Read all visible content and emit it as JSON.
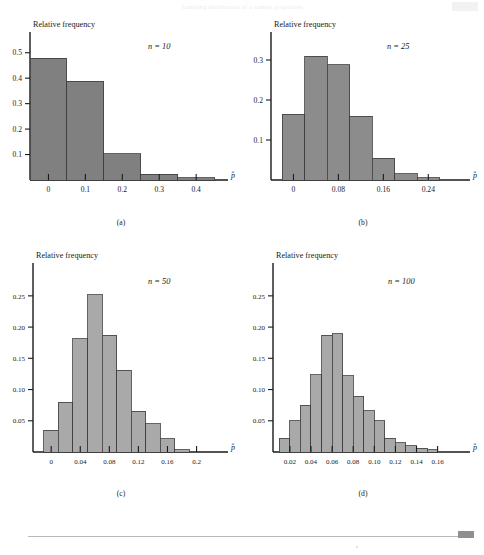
{
  "page": {
    "running_head": "Sampling distribution of a sample proportion",
    "footer_marker": "▬"
  },
  "figure": {
    "y_axis_title": "Relative frequency",
    "x_axis_symbol": "p̂",
    "panels": [
      {
        "id": "a",
        "caption": "(a)",
        "n_label": "n = 10",
        "n_value": 10,
        "bar_color": "#808080",
        "chart_data": {
          "type": "bar",
          "title": "Relative frequency",
          "xlabel": "p̂",
          "ylabel": "Relative frequency",
          "ylim": [
            0,
            0.55
          ],
          "xlim": [
            -0.05,
            0.47
          ],
          "grid": false,
          "legend": "none",
          "y_ticks": [
            0.1,
            0.2,
            0.3,
            0.4,
            0.5
          ],
          "y_tick_labels": [
            "0.1",
            "0.2",
            "0.3",
            "0.4",
            "0.5"
          ],
          "x_ticks": [
            0,
            0.1,
            0.2,
            0.3,
            0.4
          ],
          "x_tick_labels": [
            "0",
            "0.1",
            "0.2",
            "0.3",
            "0.4"
          ],
          "bin_width": 0.1,
          "bin_starts": [
            -0.05,
            0.05,
            0.15,
            0.25,
            0.35
          ],
          "categories": [
            "0.00",
            "0.10",
            "0.20",
            "0.30",
            "0.40"
          ],
          "values": [
            0.478,
            0.388,
            0.104,
            0.022,
            0.008
          ]
        }
      },
      {
        "id": "b",
        "caption": "(b)",
        "n_label": "n = 25",
        "n_value": 25,
        "bar_color": "#8c8c8c",
        "chart_data": {
          "type": "bar",
          "title": "Relative frequency",
          "xlabel": "p̂",
          "ylabel": "Relative frequency",
          "ylim": [
            0,
            0.345
          ],
          "xlim": [
            -0.04,
            0.3
          ],
          "grid": false,
          "legend": "none",
          "y_ticks": [
            0.1,
            0.2,
            0.3
          ],
          "y_tick_labels": [
            "0.1",
            "0.2",
            "0.3"
          ],
          "x_ticks": [
            0,
            0.08,
            0.16,
            0.24
          ],
          "x_tick_labels": [
            "0",
            "0.08",
            "0.16",
            "0.24"
          ],
          "bin_width": 0.04,
          "bin_starts": [
            -0.02,
            0.02,
            0.06,
            0.1,
            0.14,
            0.18,
            0.22
          ],
          "categories": [
            "0.00",
            "0.04",
            "0.08",
            "0.12",
            "0.16",
            "0.20",
            "0.24"
          ],
          "values": [
            0.165,
            0.31,
            0.288,
            0.16,
            0.055,
            0.016,
            0.006
          ]
        }
      },
      {
        "id": "c",
        "caption": "(c)",
        "n_label": "n = 50",
        "n_value": 50,
        "bar_color": "#a9a9a9",
        "chart_data": {
          "type": "bar",
          "title": "Relative frequency",
          "xlabel": "p̂",
          "ylabel": "Relative frequency",
          "ylim": [
            0,
            0.285
          ],
          "xlim": [
            -0.025,
            0.235
          ],
          "grid": false,
          "legend": "none",
          "y_ticks": [
            0.05,
            0.1,
            0.15,
            0.2,
            0.25
          ],
          "y_tick_labels": [
            "0.05",
            "0.10",
            "0.15",
            "0.20",
            "0.25"
          ],
          "x_ticks": [
            0,
            0.04,
            0.08,
            0.12,
            0.16,
            0.2
          ],
          "x_tick_labels": [
            "0",
            "0.04",
            "0.08",
            "0.12",
            "0.16",
            "0.2"
          ],
          "bin_width": 0.02,
          "bin_starts": [
            -0.01,
            0.01,
            0.03,
            0.05,
            0.07,
            0.09,
            0.11,
            0.13,
            0.15,
            0.17
          ],
          "categories": [
            "0.00",
            "0.02",
            "0.04",
            "0.06",
            "0.08",
            "0.10",
            "0.12",
            "0.14",
            "0.16",
            "0.18"
          ],
          "values": [
            0.035,
            0.08,
            0.181,
            0.252,
            0.187,
            0.131,
            0.065,
            0.045,
            0.021,
            0.004
          ]
        }
      },
      {
        "id": "d",
        "caption": "(d)",
        "n_label": "n = 100",
        "n_value": 100,
        "bar_color": "#a9a9a9",
        "chart_data": {
          "type": "bar",
          "title": "Relative frequency",
          "xlabel": "p̂",
          "ylabel": "Relative frequency",
          "ylim": [
            0,
            0.285
          ],
          "xlim": [
            0.004,
            0.185
          ],
          "grid": false,
          "legend": "none",
          "y_ticks": [
            0.05,
            0.1,
            0.15,
            0.2,
            0.25
          ],
          "y_tick_labels": [
            "0.05",
            "0.10",
            "0.15",
            "0.20",
            "0.25"
          ],
          "x_ticks": [
            0.02,
            0.04,
            0.06,
            0.08,
            0.1,
            0.12,
            0.14,
            0.16
          ],
          "x_tick_labels": [
            "0.02",
            "0.04",
            "0.06",
            "0.08",
            "0.10",
            "0.12",
            "0.14",
            "0.16"
          ],
          "bin_width": 0.01,
          "bin_starts": [
            0.01,
            0.02,
            0.03,
            0.04,
            0.05,
            0.06,
            0.07,
            0.08,
            0.09,
            0.1,
            0.11,
            0.12,
            0.13,
            0.14,
            0.15
          ],
          "categories": [
            "0.015",
            "0.025",
            "0.035",
            "0.045",
            "0.055",
            "0.065",
            "0.075",
            "0.085",
            "0.095",
            "0.105",
            "0.115",
            "0.125",
            "0.135",
            "0.145",
            "0.155"
          ],
          "values": [
            0.022,
            0.05,
            0.075,
            0.124,
            0.187,
            0.189,
            0.122,
            0.089,
            0.066,
            0.05,
            0.022,
            0.015,
            0.01,
            0.006,
            0.004
          ]
        }
      }
    ]
  }
}
